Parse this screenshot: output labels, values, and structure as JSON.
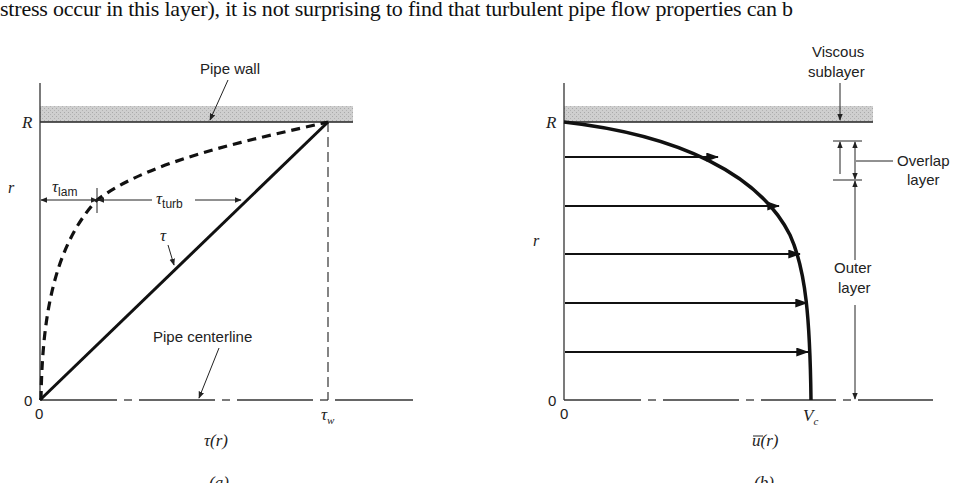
{
  "header": {
    "text": "stress occur in this layer), it is not surprising to find that turbulent pipe flow properties can b"
  },
  "panel_a": {
    "caption": "(a)",
    "x_axis_label": "τ(r)",
    "y_axis_label": "r",
    "y_tick_top": "R",
    "y_tick_origin": "0",
    "x_tick_origin": "0",
    "x_tick_wall": "τ",
    "x_tick_wall_sub": "w",
    "pipe_wall_label": "Pipe wall",
    "centerline_label": "Pipe centerline",
    "tau_label": "τ",
    "tau_lam_label": "τ",
    "tau_lam_sub": "lam",
    "tau_turb_label": "τ",
    "tau_turb_sub": "turb"
  },
  "panel_b": {
    "caption": "(b)",
    "x_axis_label": "u(r)",
    "y_axis_label": "r",
    "y_tick_top": "R",
    "y_tick_origin": "0",
    "x_tick_origin": "0",
    "x_tick_center": "V",
    "x_tick_center_sub": "c",
    "viscous_label_1": "Viscous",
    "viscous_label_2": "sublayer",
    "overlap_label_1": "Overlap",
    "overlap_label_2": "layer",
    "outer_label_1": "Outer",
    "outer_label_2": "layer"
  },
  "colors": {
    "ink": "#111111",
    "wall_fill": "#c8c8c8",
    "axis": "#333333"
  }
}
